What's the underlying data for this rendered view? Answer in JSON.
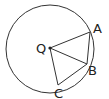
{
  "diagram": {
    "type": "circle-geometry",
    "circle": {
      "cx": 50,
      "cy": 49,
      "r": 44,
      "stroke": "#333333",
      "label": "circle centered at Q"
    },
    "points": {
      "Q": {
        "x": 50,
        "y": 48,
        "label": "Q",
        "lx": 36,
        "ly": 53
      },
      "A": {
        "x": 90,
        "y": 32,
        "label": "A",
        "lx": 93,
        "ly": 33
      },
      "B": {
        "x": 87,
        "y": 64,
        "label": "B",
        "lx": 88,
        "ly": 75
      },
      "C": {
        "x": 58,
        "y": 85,
        "label": "C",
        "lx": 54,
        "ly": 98
      }
    },
    "segments": [
      {
        "from": "Q",
        "to": "A"
      },
      {
        "from": "Q",
        "to": "B"
      },
      {
        "from": "Q",
        "to": "C"
      },
      {
        "from": "A",
        "to": "B"
      },
      {
        "from": "B",
        "to": "C"
      }
    ],
    "colors": {
      "stroke": "#333333",
      "background": "#ffffff",
      "text": "#222222"
    }
  }
}
